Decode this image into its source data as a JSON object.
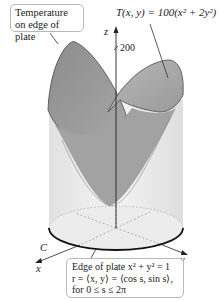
{
  "figure": {
    "type": "3d-surface-diagram",
    "surface_label": "T(x, y) = 100(x² + 2y²)",
    "axes": {
      "z_label": "z",
      "x_label": "x",
      "y_label": "y",
      "z_tick": "200"
    },
    "curve_label": "C",
    "callout_top": {
      "line1": "Temperature",
      "line2": "on edge of plate"
    },
    "callout_bottom": {
      "line1": "Edge of plate x² + y² = 1",
      "line2": "r = ⟨x, y⟩ = ⟨cos s, sin s⟩,",
      "line3": "for 0 ≤ s ≤ 2π"
    },
    "colors": {
      "surface_dark": "#8a8a8a",
      "surface_light": "#b5b5b5",
      "cylinder": "#e6e6e6",
      "disk": "#efefef",
      "edge": "#111111",
      "callout_border": "#b8b8b8"
    }
  }
}
